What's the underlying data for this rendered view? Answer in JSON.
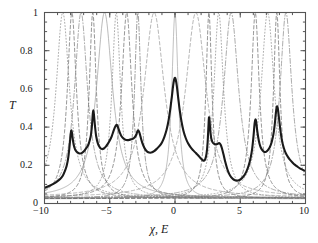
{
  "chart_data": {
    "type": "line",
    "title": "",
    "xlabel": "χ, E",
    "ylabel": "T",
    "xlim": [
      -10,
      10
    ],
    "ylim": [
      0,
      1
    ],
    "grid": false,
    "legend": "none",
    "xticks": [
      -10,
      -5,
      0,
      5,
      10
    ],
    "xtick_labels": [
      "−10",
      "−5",
      "0",
      "5",
      "10"
    ],
    "yticks": [
      0,
      0.2,
      0.4,
      0.6,
      0.8,
      1
    ],
    "ytick_labels": [
      "0",
      "0.2",
      "0.4",
      "0.6",
      "0.8",
      "1"
    ],
    "x_minor_tick_step": 1,
    "y_minor_tick_step": 0.05,
    "series": [
      {
        "name": "total-transmission",
        "style": "solid",
        "color": "#1a1a1a",
        "width": 2.1,
        "points": [
          [
            -10.0,
            0.082
          ],
          [
            -9.7,
            0.09
          ],
          [
            -9.4,
            0.1
          ],
          [
            -9.1,
            0.112
          ],
          [
            -8.8,
            0.128
          ],
          [
            -8.6,
            0.145
          ],
          [
            -8.45,
            0.168
          ],
          [
            -8.3,
            0.198
          ],
          [
            -8.18,
            0.24
          ],
          [
            -8.08,
            0.3
          ],
          [
            -8.0,
            0.36
          ],
          [
            -7.95,
            0.382
          ],
          [
            -7.9,
            0.372
          ],
          [
            -7.82,
            0.33
          ],
          [
            -7.72,
            0.296
          ],
          [
            -7.6,
            0.276
          ],
          [
            -7.45,
            0.266
          ],
          [
            -7.3,
            0.262
          ],
          [
            -7.15,
            0.264
          ],
          [
            -7.0,
            0.272
          ],
          [
            -6.85,
            0.285
          ],
          [
            -6.7,
            0.3
          ],
          [
            -6.58,
            0.32
          ],
          [
            -6.45,
            0.355
          ],
          [
            -6.36,
            0.412
          ],
          [
            -6.3,
            0.47
          ],
          [
            -6.26,
            0.488
          ],
          [
            -6.22,
            0.47
          ],
          [
            -6.14,
            0.412
          ],
          [
            -6.04,
            0.352
          ],
          [
            -5.9,
            0.312
          ],
          [
            -5.75,
            0.292
          ],
          [
            -5.6,
            0.285
          ],
          [
            -5.45,
            0.288
          ],
          [
            -5.3,
            0.298
          ],
          [
            -5.15,
            0.312
          ],
          [
            -5.0,
            0.33
          ],
          [
            -4.85,
            0.352
          ],
          [
            -4.72,
            0.378
          ],
          [
            -4.6,
            0.4
          ],
          [
            -4.5,
            0.412
          ],
          [
            -4.42,
            0.408
          ],
          [
            -4.33,
            0.392
          ],
          [
            -4.22,
            0.37
          ],
          [
            -4.1,
            0.352
          ],
          [
            -3.95,
            0.34
          ],
          [
            -3.8,
            0.334
          ],
          [
            -3.65,
            0.332
          ],
          [
            -3.5,
            0.333
          ],
          [
            -3.35,
            0.336
          ],
          [
            -3.2,
            0.34
          ],
          [
            -3.08,
            0.348
          ],
          [
            -2.97,
            0.36
          ],
          [
            -2.88,
            0.378
          ],
          [
            -2.8,
            0.382
          ],
          [
            -2.72,
            0.37
          ],
          [
            -2.62,
            0.344
          ],
          [
            -2.5,
            0.316
          ],
          [
            -2.35,
            0.292
          ],
          [
            -2.2,
            0.276
          ],
          [
            -2.05,
            0.268
          ],
          [
            -1.9,
            0.266
          ],
          [
            -1.75,
            0.268
          ],
          [
            -1.6,
            0.274
          ],
          [
            -1.4,
            0.286
          ],
          [
            -1.2,
            0.3
          ],
          [
            -1.0,
            0.32
          ],
          [
            -0.82,
            0.348
          ],
          [
            -0.65,
            0.385
          ],
          [
            -0.5,
            0.432
          ],
          [
            -0.36,
            0.495
          ],
          [
            -0.24,
            0.56
          ],
          [
            -0.14,
            0.618
          ],
          [
            -0.06,
            0.65
          ],
          [
            0.0,
            0.658
          ],
          [
            0.06,
            0.648
          ],
          [
            0.14,
            0.614
          ],
          [
            0.24,
            0.556
          ],
          [
            0.36,
            0.49
          ],
          [
            0.5,
            0.428
          ],
          [
            0.65,
            0.38
          ],
          [
            0.82,
            0.343
          ],
          [
            1.0,
            0.315
          ],
          [
            1.2,
            0.294
          ],
          [
            1.4,
            0.278
          ],
          [
            1.6,
            0.264
          ],
          [
            1.8,
            0.25
          ],
          [
            1.95,
            0.238
          ],
          [
            2.1,
            0.228
          ],
          [
            2.22,
            0.224
          ],
          [
            2.32,
            0.232
          ],
          [
            2.42,
            0.262
          ],
          [
            2.5,
            0.32
          ],
          [
            2.56,
            0.4
          ],
          [
            2.6,
            0.448
          ],
          [
            2.64,
            0.44
          ],
          [
            2.7,
            0.385
          ],
          [
            2.78,
            0.34
          ],
          [
            2.88,
            0.32
          ],
          [
            3.0,
            0.312
          ],
          [
            3.12,
            0.31
          ],
          [
            3.25,
            0.312
          ],
          [
            3.38,
            0.316
          ],
          [
            3.5,
            0.308
          ],
          [
            3.6,
            0.288
          ],
          [
            3.72,
            0.256
          ],
          [
            3.85,
            0.218
          ],
          [
            4.0,
            0.182
          ],
          [
            4.15,
            0.155
          ],
          [
            4.3,
            0.138
          ],
          [
            4.45,
            0.128
          ],
          [
            4.6,
            0.122
          ],
          [
            4.75,
            0.12
          ],
          [
            4.9,
            0.122
          ],
          [
            5.05,
            0.128
          ],
          [
            5.2,
            0.138
          ],
          [
            5.35,
            0.152
          ],
          [
            5.5,
            0.172
          ],
          [
            5.65,
            0.2
          ],
          [
            5.8,
            0.24
          ],
          [
            5.92,
            0.29
          ],
          [
            6.02,
            0.355
          ],
          [
            6.1,
            0.42
          ],
          [
            6.16,
            0.44
          ],
          [
            6.22,
            0.428
          ],
          [
            6.3,
            0.382
          ],
          [
            6.42,
            0.33
          ],
          [
            6.55,
            0.296
          ],
          [
            6.7,
            0.278
          ],
          [
            6.85,
            0.27
          ],
          [
            7.0,
            0.272
          ],
          [
            7.15,
            0.282
          ],
          [
            7.3,
            0.3
          ],
          [
            7.42,
            0.325
          ],
          [
            7.54,
            0.362
          ],
          [
            7.64,
            0.412
          ],
          [
            7.72,
            0.468
          ],
          [
            7.78,
            0.502
          ],
          [
            7.84,
            0.508
          ],
          [
            7.9,
            0.488
          ],
          [
            7.98,
            0.44
          ],
          [
            8.08,
            0.382
          ],
          [
            8.2,
            0.328
          ],
          [
            8.35,
            0.288
          ],
          [
            8.5,
            0.262
          ],
          [
            8.65,
            0.244
          ],
          [
            8.8,
            0.23
          ],
          [
            9.0,
            0.215
          ],
          [
            9.2,
            0.202
          ],
          [
            9.4,
            0.192
          ],
          [
            9.6,
            0.183
          ],
          [
            9.8,
            0.176
          ],
          [
            10.0,
            0.17
          ]
        ]
      }
    ],
    "resonance_curves": [
      {
        "name": "res-1",
        "center": -8.6,
        "hwhm": 0.62,
        "floor": 0.03,
        "style": "dotted",
        "color": "#8c8c8c"
      },
      {
        "name": "res-2",
        "center": -7.9,
        "hwhm": 0.42,
        "floor": 0.028,
        "style": "dashed",
        "color": "#707070"
      },
      {
        "name": "res-3",
        "center": -7.2,
        "hwhm": 0.6,
        "floor": 0.03,
        "style": "dashdot",
        "color": "#8c8c8c"
      },
      {
        "name": "res-4",
        "center": -6.3,
        "hwhm": 0.33,
        "floor": 0.026,
        "style": "dashed",
        "color": "#6b6b6b"
      },
      {
        "name": "res-5",
        "center": -5.4,
        "hwhm": 0.75,
        "floor": 0.03,
        "style": "solid",
        "color": "#a0a0a0"
      },
      {
        "name": "res-6",
        "center": -4.5,
        "hwhm": 0.4,
        "floor": 0.028,
        "style": "dotted",
        "color": "#8c8c8c"
      },
      {
        "name": "res-7",
        "center": -3.7,
        "hwhm": 0.48,
        "floor": 0.03,
        "style": "dashed",
        "color": "#707070"
      },
      {
        "name": "res-8",
        "center": -2.85,
        "hwhm": 0.3,
        "floor": 0.026,
        "style": "dashdot",
        "color": "#7a7a7a"
      },
      {
        "name": "res-9",
        "center": -1.6,
        "hwhm": 0.95,
        "floor": 0.032,
        "style": "dashed",
        "color": "#9a9a9a"
      },
      {
        "name": "res-10",
        "center": 0.0,
        "hwhm": 0.3,
        "floor": 0.024,
        "style": "solid",
        "color": "#a8a8a8"
      },
      {
        "name": "res-11",
        "center": 1.6,
        "hwhm": 0.95,
        "floor": 0.032,
        "style": "dashed",
        "color": "#9a9a9a"
      },
      {
        "name": "res-12",
        "center": 2.6,
        "hwhm": 0.28,
        "floor": 0.026,
        "style": "dashed",
        "color": "#6b6b6b"
      },
      {
        "name": "res-13",
        "center": 3.35,
        "hwhm": 0.45,
        "floor": 0.028,
        "style": "dotted",
        "color": "#8c8c8c"
      },
      {
        "name": "res-14",
        "center": 4.3,
        "hwhm": 0.7,
        "floor": 0.03,
        "style": "dashdot",
        "color": "#8c8c8c"
      },
      {
        "name": "res-15",
        "center": 6.15,
        "hwhm": 0.38,
        "floor": 0.028,
        "style": "dashed",
        "color": "#707070"
      },
      {
        "name": "res-16",
        "center": 7.1,
        "hwhm": 0.62,
        "floor": 0.03,
        "style": "dotted",
        "color": "#909090"
      },
      {
        "name": "res-17",
        "center": 7.8,
        "hwhm": 0.3,
        "floor": 0.026,
        "style": "dashed",
        "color": "#6b6b6b"
      },
      {
        "name": "res-18",
        "center": 8.5,
        "hwhm": 0.55,
        "floor": 0.03,
        "style": "dashdot",
        "color": "#8c8c8c"
      }
    ],
    "notes": {
      "main_peak_values": [
        0.38,
        0.49,
        0.41,
        0.38,
        0.66,
        0.45,
        0.44,
        0.51
      ],
      "main_peak_positions": [
        -7.95,
        -6.26,
        -4.5,
        -2.8,
        0.0,
        2.62,
        6.16,
        7.84
      ],
      "left_edge_value": 0.082,
      "right_edge_value": 0.17
    }
  },
  "axes": {
    "frame_color": "#555555",
    "tick_color": "#555555"
  }
}
